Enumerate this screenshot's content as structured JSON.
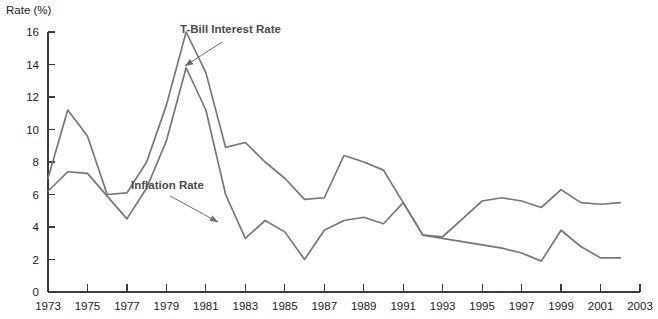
{
  "chart_data": {
    "type": "line",
    "title": "",
    "xlabel": "",
    "ylabel": "Rate (%)",
    "ylim": [
      0,
      16
    ],
    "xlim": [
      1973,
      2003
    ],
    "grid": false,
    "legend_position": "inline-annotations",
    "y_ticks": [
      0,
      2,
      4,
      6,
      8,
      10,
      12,
      14,
      16
    ],
    "y_tick_labels": [
      "0",
      "2",
      "4",
      "6",
      "8",
      "10",
      "12",
      "14",
      "16"
    ],
    "x_ticks": [
      1973,
      1975,
      1977,
      1979,
      1981,
      1983,
      1985,
      1987,
      1989,
      1991,
      1993,
      1995,
      1997,
      1999,
      2001,
      2003
    ],
    "x_tick_labels": [
      "1973",
      "1975",
      "1977",
      "1979",
      "1981",
      "1983",
      "1985",
      "1987",
      "1989",
      "1991",
      "1993",
      "1995",
      "1997",
      "1999",
      "2001",
      "2003"
    ],
    "x": [
      1973,
      1974,
      1975,
      1976,
      1977,
      1978,
      1979,
      1980,
      1981,
      1982,
      1983,
      1984,
      1985,
      1986,
      1987,
      1988,
      1989,
      1990,
      1991,
      1992,
      1993,
      1994,
      1995,
      1996,
      1997,
      1998,
      1999,
      2000,
      2001,
      2002
    ],
    "series": [
      {
        "name": "T-Bill Interest Rate",
        "color": "#767676",
        "values": [
          7.0,
          11.2,
          9.6,
          6.0,
          6.1,
          8.0,
          11.5,
          16.0,
          13.5,
          8.9,
          9.2,
          8.0,
          7.0,
          5.7,
          5.8,
          8.4,
          8.0,
          7.5,
          5.5,
          3.5,
          3.4,
          4.5,
          5.6,
          5.8,
          5.6,
          5.2,
          6.3,
          5.5,
          5.4,
          5.5
        ]
      },
      {
        "name": "Inflation Rate",
        "color": "#767676",
        "values": [
          6.2,
          7.4,
          7.3,
          5.9,
          4.5,
          6.4,
          9.3,
          13.8,
          11.2,
          6.0,
          3.3,
          4.4,
          3.7,
          2.0,
          3.8,
          4.4,
          4.6,
          4.2,
          5.5,
          3.5,
          3.3,
          3.1,
          2.9,
          2.7,
          2.4,
          1.9,
          3.8,
          2.8,
          2.1,
          2.1
        ]
      }
    ],
    "annotations": [
      {
        "text": "T-Bill Interest Rate",
        "label_x": 180,
        "label_y": 33,
        "leader_from_x": 222,
        "leader_from_y": 42,
        "leader_to_x": 185,
        "leader_to_y": 66
      },
      {
        "text": "Inflation Rate",
        "label_x": 131,
        "label_y": 189,
        "leader_from_x": 170,
        "leader_from_y": 196,
        "leader_to_x": 218,
        "leader_to_y": 222
      }
    ]
  }
}
